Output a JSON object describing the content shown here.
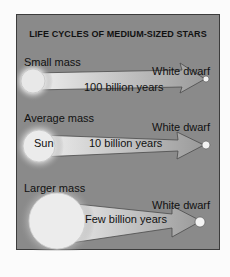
{
  "diagram": {
    "title": "LIFE CYCLES OF MEDIUM-SIZED STARS",
    "rows": [
      {
        "mass_label": "Small mass",
        "star_label": "",
        "duration": "100 billion years",
        "end_label": "White dwarf"
      },
      {
        "mass_label": "Average mass",
        "star_label": "Sun",
        "duration": "10 billion years",
        "end_label": "White dwarf"
      },
      {
        "mass_label": "Larger mass",
        "star_label": "",
        "duration": "Few billion years",
        "end_label": "White dwarf"
      }
    ],
    "colors": {
      "background": "#8a8a8a",
      "border": "#3c3c3c",
      "glow": "#f4f4f4",
      "text": "#111111"
    }
  }
}
